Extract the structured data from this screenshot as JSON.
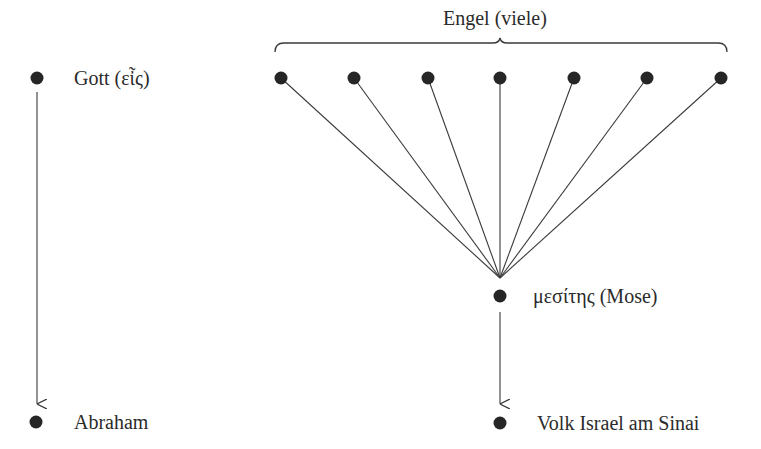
{
  "diagram": {
    "colors": {
      "ink": "#262626",
      "line": "#3a3a3a",
      "background": "#ffffff"
    },
    "group_label": "Engel (viele)",
    "nodes": {
      "gott": {
        "label": "Gott (εἶς)",
        "x": 37,
        "y": 78
      },
      "abraham": {
        "label": "Abraham",
        "x": 36,
        "y": 422
      },
      "mediator": {
        "label": "μεσίτης (Mose)",
        "x": 500,
        "y": 296
      },
      "volk": {
        "label": "Volk Israel am Sinai",
        "x": 500,
        "y": 423
      }
    },
    "angels": [
      {
        "x": 281,
        "y": 78
      },
      {
        "x": 354,
        "y": 78
      },
      {
        "x": 428,
        "y": 78
      },
      {
        "x": 500,
        "y": 78
      },
      {
        "x": 574,
        "y": 78
      },
      {
        "x": 647,
        "y": 78
      },
      {
        "x": 721,
        "y": 78
      }
    ],
    "convergence_point": {
      "x": 500,
      "y": 278
    },
    "edges": [
      {
        "from": "gott",
        "to": "abraham",
        "type": "arrow"
      },
      {
        "from": "angels",
        "to": "mediator",
        "type": "converging-lines"
      },
      {
        "from": "mediator",
        "to": "volk",
        "type": "arrow"
      }
    ]
  }
}
